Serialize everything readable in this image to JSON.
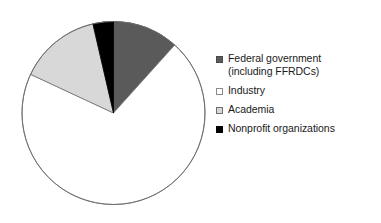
{
  "chart_data": {
    "type": "pie",
    "title": "",
    "subtitle": "",
    "xlabel": "",
    "ylabel": "",
    "grid": false,
    "legend_position": "right",
    "start_angle_deg": 0,
    "direction": "clockwise",
    "categories": [
      "Federal government (including FFRDCs)",
      "Industry",
      "Academia",
      "Nonprofit organizations"
    ],
    "values": [
      11.7,
      70.3,
      14.4,
      3.6
    ],
    "slices": [
      {
        "label": "Federal government (including FFRDCs)",
        "value": 11.7,
        "start_deg": 0,
        "end_deg": 42,
        "fill": "#5a5a5a",
        "stroke": "#4a4a4a"
      },
      {
        "label": "Industry",
        "value": 70.3,
        "start_deg": 42,
        "end_deg": 295,
        "fill": "#ffffff",
        "stroke": "#7a7a7a"
      },
      {
        "label": "Academia",
        "value": 14.4,
        "start_deg": 295,
        "end_deg": 347,
        "fill": "#d8d8d8",
        "stroke": "#6e6e6e"
      },
      {
        "label": "Nonprofit organizations",
        "value": 3.6,
        "start_deg": 347,
        "end_deg": 360,
        "fill": "#000000",
        "stroke": "#000000"
      }
    ]
  },
  "pie": {
    "center_x": 113.5,
    "center_y": 113,
    "radius": 91.5,
    "outline_color": "#6f6f6f"
  },
  "legend": {
    "items": [
      {
        "label": "Federal government\n(including FFRDCs)",
        "swatch_name": "legend-swatch-federal-government",
        "swatch_class": "sw-federal"
      },
      {
        "label": "Industry",
        "swatch_name": "legend-swatch-industry",
        "swatch_class": "sw-industry"
      },
      {
        "label": "Academia",
        "swatch_name": "legend-swatch-academia",
        "swatch_class": "sw-academia"
      },
      {
        "label": "Nonprofit organizations",
        "swatch_name": "legend-swatch-nonprofit-organizations",
        "swatch_class": "sw-nonprofit"
      }
    ]
  }
}
